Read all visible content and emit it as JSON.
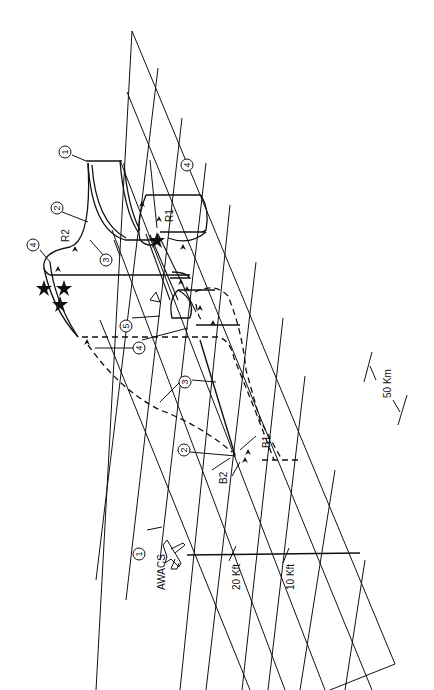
{
  "figure": {
    "orientation": "rotated-90-ccw",
    "colors": {
      "ink": "#111111",
      "background": "#ffffff"
    }
  },
  "labels": {
    "awacs": "AWACS",
    "alt_20": "20 Kft",
    "alt_10": "10 Kft",
    "distance": "50 Km",
    "r1": "R1",
    "r2": "R2",
    "b1": "B1",
    "b2": "B2"
  },
  "callouts": [
    {
      "id": "c1-awacs",
      "text": "1"
    },
    {
      "id": "c1-r2",
      "text": "1"
    },
    {
      "id": "c2-r2",
      "text": "2"
    },
    {
      "id": "c3-r2",
      "text": "3"
    },
    {
      "id": "c4-r1",
      "text": "4"
    },
    {
      "id": "c4-r2",
      "text": "4"
    },
    {
      "id": "c5",
      "text": "5"
    },
    {
      "id": "c4-mid",
      "text": "4"
    },
    {
      "id": "c3-b",
      "text": "3"
    },
    {
      "id": "c2-b",
      "text": "2"
    }
  ]
}
